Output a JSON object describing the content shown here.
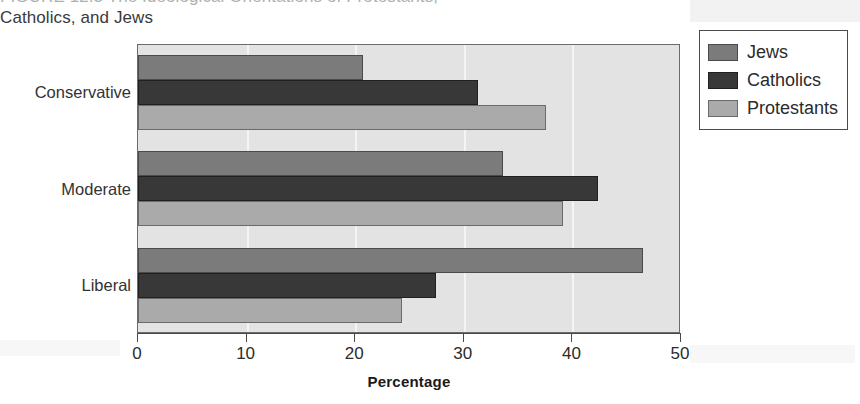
{
  "figure": {
    "title_line1": "FIGURE 12.3   The Ideological Orientations of Protestants,",
    "title_line2": "Catholics, and Jews"
  },
  "legend": {
    "position": "right-top",
    "entries": [
      {
        "label": "Jews",
        "color": "#7b7b7b",
        "swatch": "jews-swatch"
      },
      {
        "label": "Catholics",
        "color": "#383838",
        "swatch": "catholics-swatch"
      },
      {
        "label": "Protestants",
        "color": "#aaaaaa",
        "swatch": "protestants-swatch"
      }
    ]
  },
  "axes": {
    "x_title": "Percentage",
    "x_ticks": [
      "0",
      "10",
      "20",
      "30",
      "40",
      "50"
    ],
    "y_categories": [
      "Conservative",
      "Moderate",
      "Liberal"
    ]
  },
  "chart_data": {
    "type": "bar",
    "orientation": "horizontal",
    "title": "FIGURE 12.3   The Ideological Orientations of Protestants, Catholics, and Jews",
    "xlabel": "Percentage",
    "ylabel": "",
    "xlim": [
      0,
      50
    ],
    "xticks": [
      0,
      10,
      20,
      30,
      40,
      50
    ],
    "grid": true,
    "grid_axis": "x",
    "legend_position": "right",
    "categories": [
      "Conservative",
      "Moderate",
      "Liberal"
    ],
    "series": [
      {
        "name": "Jews",
        "color": "#7b7b7b",
        "values": [
          20.7,
          33.6,
          46.5
        ]
      },
      {
        "name": "Catholics",
        "color": "#383838",
        "values": [
          31.3,
          42.4,
          27.4
        ]
      },
      {
        "name": "Protestants",
        "color": "#aaaaaa",
        "values": [
          37.6,
          39.1,
          24.3
        ]
      }
    ],
    "plot_background": "#e3e3e3",
    "gridline_color": "#f4f4f4"
  },
  "geometry": {
    "plot_left_px": 137,
    "plot_top_px": 44,
    "plot_width_px": 543,
    "plot_height_px": 289,
    "px_per_unit": 10.88,
    "bar_height_px": 25,
    "group_band_px": 96.3
  }
}
